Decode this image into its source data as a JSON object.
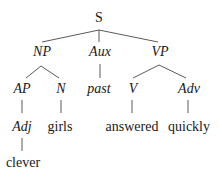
{
  "diagram": {
    "type": "syntax-tree",
    "nodes": [
      {
        "id": "S",
        "label": "S",
        "italic": false,
        "x": 99,
        "y": 18
      },
      {
        "id": "NP",
        "label": "NP",
        "italic": true,
        "x": 42,
        "y": 52
      },
      {
        "id": "Aux",
        "label": "Aux",
        "italic": true,
        "x": 100,
        "y": 52
      },
      {
        "id": "VP",
        "label": "VP",
        "italic": true,
        "x": 160,
        "y": 52
      },
      {
        "id": "AP",
        "label": "AP",
        "italic": true,
        "x": 22,
        "y": 89
      },
      {
        "id": "N",
        "label": "N",
        "italic": true,
        "x": 61,
        "y": 89
      },
      {
        "id": "past",
        "label": "past",
        "italic": true,
        "x": 99,
        "y": 89
      },
      {
        "id": "V",
        "label": "V",
        "italic": true,
        "x": 133,
        "y": 89
      },
      {
        "id": "Adv",
        "label": "Adv",
        "italic": true,
        "x": 189,
        "y": 89
      },
      {
        "id": "Adj",
        "label": "Adj",
        "italic": true,
        "x": 22,
        "y": 127
      },
      {
        "id": "girls",
        "label": "girls",
        "italic": false,
        "x": 60,
        "y": 127
      },
      {
        "id": "answered",
        "label": "answered",
        "italic": false,
        "x": 132,
        "y": 127
      },
      {
        "id": "quickly",
        "label": "quickly",
        "italic": false,
        "x": 189,
        "y": 127
      },
      {
        "id": "clever",
        "label": "clever",
        "italic": false,
        "x": 23,
        "y": 163
      }
    ],
    "edges": [
      {
        "from": "S",
        "to": "NP",
        "x1": 99,
        "y1": 30,
        "x2": 42,
        "y2": 42
      },
      {
        "from": "S",
        "to": "Aux",
        "x1": 99,
        "y1": 30,
        "x2": 99,
        "y2": 42
      },
      {
        "from": "S",
        "to": "VP",
        "x1": 99,
        "y1": 30,
        "x2": 158,
        "y2": 42
      },
      {
        "from": "NP",
        "to": "AP",
        "x1": 41,
        "y1": 66,
        "x2": 26,
        "y2": 78
      },
      {
        "from": "NP",
        "to": "N",
        "x1": 41,
        "y1": 66,
        "x2": 59,
        "y2": 78
      },
      {
        "from": "Aux",
        "to": "past",
        "x1": 100,
        "y1": 64,
        "x2": 100,
        "y2": 78
      },
      {
        "from": "VP",
        "to": "V",
        "x1": 159,
        "y1": 65,
        "x2": 133,
        "y2": 78
      },
      {
        "from": "VP",
        "to": "Adv",
        "x1": 159,
        "y1": 65,
        "x2": 186,
        "y2": 78
      },
      {
        "from": "AP",
        "to": "Adj",
        "x1": 22,
        "y1": 100,
        "x2": 22,
        "y2": 113
      },
      {
        "from": "N",
        "to": "girls",
        "x1": 61,
        "y1": 100,
        "x2": 61,
        "y2": 113
      },
      {
        "from": "V",
        "to": "answered",
        "x1": 132,
        "y1": 100,
        "x2": 132,
        "y2": 113
      },
      {
        "from": "Adv",
        "to": "quickly",
        "x1": 188,
        "y1": 100,
        "x2": 188,
        "y2": 113
      },
      {
        "from": "Adj",
        "to": "clever",
        "x1": 22,
        "y1": 138,
        "x2": 22,
        "y2": 151
      }
    ]
  },
  "labels": {
    "S": "S",
    "NP": "NP",
    "Aux": "Aux",
    "VP": "VP",
    "AP": "AP",
    "N": "N",
    "past": "past",
    "V": "V",
    "Adv": "Adv",
    "Adj": "Adj",
    "girls": "girls",
    "answered": "answered",
    "quickly": "quickly",
    "clever": "clever"
  }
}
